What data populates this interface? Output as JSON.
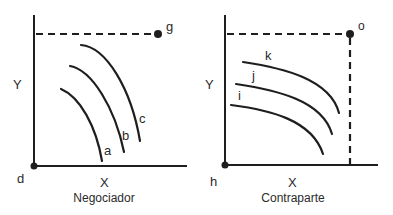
{
  "panels": [
    {
      "id": "negociador",
      "title": "Negociador",
      "x_label": "X",
      "y_label": "Y",
      "origin_label": "d",
      "ideal_point_label": "g",
      "curves": [
        {
          "label": "a"
        },
        {
          "label": "b"
        },
        {
          "label": "c"
        }
      ]
    },
    {
      "id": "contraparte",
      "title": "Contraparte",
      "x_label": "X",
      "y_label": "Y",
      "origin_label": "h",
      "ideal_point_label": "o",
      "curves": [
        {
          "label": "i"
        },
        {
          "label": "j"
        },
        {
          "label": "k"
        }
      ]
    }
  ],
  "colors": {
    "line": "#1e1e1e",
    "text": "#2a2a2a",
    "background": "#ffffff"
  }
}
